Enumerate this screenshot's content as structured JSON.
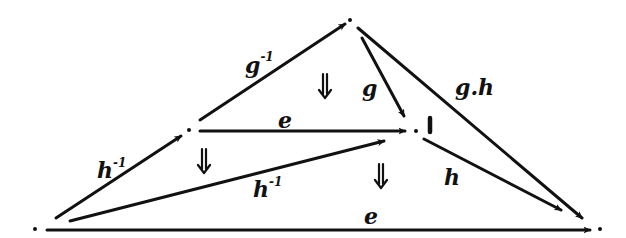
{
  "diagram": {
    "type": "hand-drawn commutative diagram (2-cells)",
    "vertices": [
      {
        "id": "A",
        "x": 35,
        "y": 229
      },
      {
        "id": "B",
        "x": 189,
        "y": 130
      },
      {
        "id": "C",
        "x": 350,
        "y": 20
      },
      {
        "id": "D",
        "x": 416,
        "y": 131
      },
      {
        "id": "E",
        "x": 600,
        "y": 229
      }
    ],
    "edges": [
      {
        "from": "A",
        "to": "B",
        "label": "h",
        "sup": "-1"
      },
      {
        "from": "B",
        "to": "C",
        "label": "g",
        "sup": "-1"
      },
      {
        "from": "B",
        "to": "D",
        "label": "e",
        "sup": ""
      },
      {
        "from": "C",
        "to": "D",
        "label": "g",
        "sup": ""
      },
      {
        "from": "C",
        "to": "E",
        "label": "g.h",
        "sup": ""
      },
      {
        "from": "D",
        "to": "E",
        "label": "h",
        "sup": ""
      },
      {
        "from": "A",
        "to": "D",
        "label": "h",
        "sup": "-1"
      },
      {
        "from": "A",
        "to": "E",
        "label": "e",
        "sup": ""
      }
    ],
    "unit_mark": "1",
    "two_cells": [
      {
        "symbol": "⇓",
        "x": 325,
        "y": 88
      },
      {
        "symbol": "⇓",
        "x": 204,
        "y": 163
      },
      {
        "symbol": "⇓",
        "x": 381,
        "y": 178
      }
    ]
  },
  "labels": {
    "ab": "h",
    "ab_sup": "-1",
    "bc": "g",
    "bc_sup": "-1",
    "bd": "e",
    "cd": "g",
    "ce": "g.h",
    "de": "h",
    "ad": "h",
    "ad_sup": "-1",
    "ae": "e",
    "unit": "1"
  }
}
